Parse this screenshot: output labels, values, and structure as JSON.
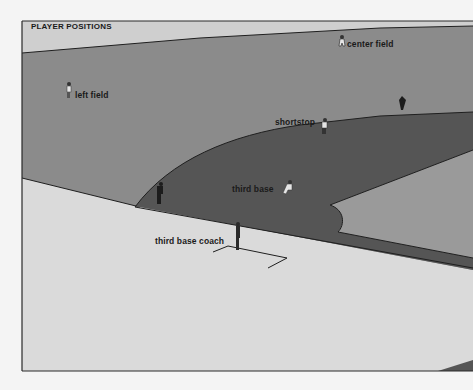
{
  "title": "PLAYER POSITIONS",
  "colors": {
    "background": "#f4f4f4",
    "sky_band": "#cfcfcf",
    "outfield": "#8b8b8b",
    "infield_dirt": "#555555",
    "infield_grass": "#9a9a9a",
    "foul_territory": "#dadada",
    "lines": "#1f1f1f"
  },
  "labels": {
    "center_field": "center field",
    "left_field": "left field",
    "shortstop": "shortstop",
    "third_base": "third base",
    "third_base_coach": "third base coach"
  },
  "figures": [
    {
      "name": "center-fielder",
      "role": "center field"
    },
    {
      "name": "left-fielder",
      "role": "left field"
    },
    {
      "name": "shortstop",
      "role": "shortstop"
    },
    {
      "name": "third-baseman",
      "role": "third base"
    },
    {
      "name": "third-base-coach",
      "role": "third base coach"
    },
    {
      "name": "umpire",
      "role": "umpire"
    },
    {
      "name": "distant-player",
      "role": "distant player"
    }
  ]
}
